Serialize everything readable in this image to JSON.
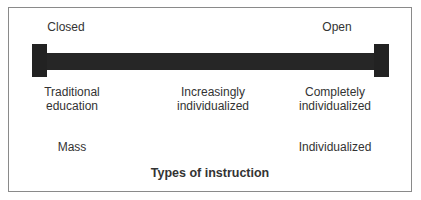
{
  "diagram": {
    "ends": {
      "left": "Closed",
      "right": "Open"
    },
    "continuum": [
      {
        "line1": "Traditional",
        "line2": "education"
      },
      {
        "line1": "Increasingly",
        "line2": "individualized"
      },
      {
        "line1": "Completely",
        "line2": "individualized"
      }
    ],
    "scale": {
      "left": "Mass",
      "right": "Individualized"
    },
    "title": "Types of instruction",
    "colors": {
      "bar": "#262626",
      "border": "#8a8a8a",
      "text": "#333333"
    }
  }
}
